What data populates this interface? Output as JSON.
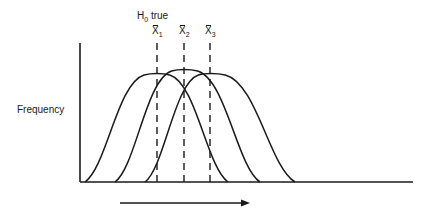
{
  "diagram": {
    "hypothesis_label": {
      "prefix": "H",
      "subscript": "0",
      "suffix": " true"
    },
    "y_axis_label": "Frequency",
    "means": [
      {
        "symbol": "X",
        "subscript": "1",
        "x": 157
      },
      {
        "symbol": "X",
        "subscript": "2",
        "x": 184
      },
      {
        "symbol": "X",
        "subscript": "3",
        "x": 210
      }
    ],
    "curves": [
      {
        "name": "distribution-1",
        "start_x": 85,
        "peak_x": 157,
        "peak_y": 73,
        "end_x": 228
      },
      {
        "name": "distribution-2",
        "start_x": 115,
        "peak_x": 184,
        "peak_y": 69,
        "end_x": 260
      },
      {
        "name": "distribution-3",
        "start_x": 145,
        "peak_x": 210,
        "peak_y": 73,
        "end_x": 295
      }
    ],
    "axes": {
      "origin_x": 80,
      "origin_y": 182,
      "top_y": 43,
      "right_x": 413
    },
    "arrow": {
      "from_x": 120,
      "to_x": 250,
      "y": 203,
      "direction": "right"
    },
    "line_color": "#1a1a1a"
  }
}
